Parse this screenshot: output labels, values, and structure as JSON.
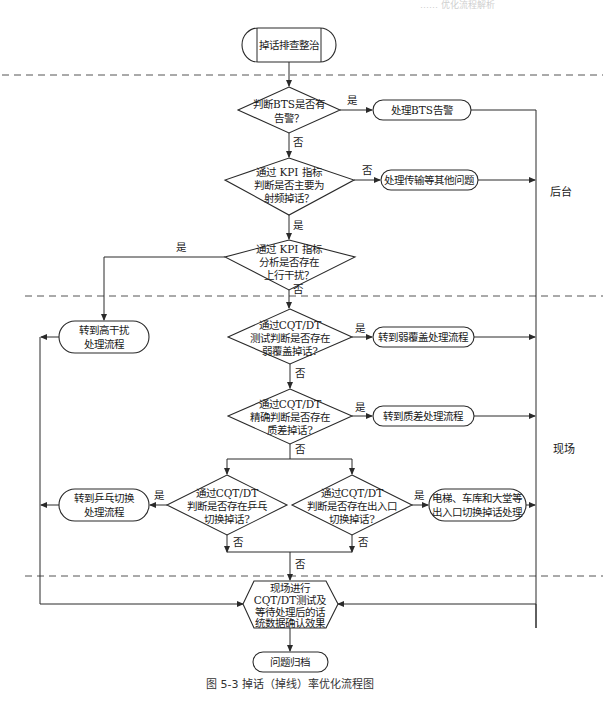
{
  "header_faint": "…… 优化流程解析",
  "zones": {
    "backend": "后台",
    "field": "现场"
  },
  "nodes": {
    "start": "掉话排查整治",
    "d_bts": [
      "判断BTS是否有",
      "告警？"
    ],
    "p_bts": "处理BTS告警",
    "d_kpi_rf": [
      "通过 KPI 指标",
      "判断是否主要为",
      "射频掉话？"
    ],
    "p_transport": "处理传输等其他问题",
    "d_kpi_ul": [
      "通过 KPI 指标",
      "分析是否存在",
      "上行干扰？"
    ],
    "p_high_interf": [
      "转到高干扰",
      "处理流程"
    ],
    "d_weak_cov": [
      "通过CQT/DT",
      "测试判断是否存在",
      "弱覆盖掉话?"
    ],
    "p_weak_cov": "转到弱覆盖处理流程",
    "d_quality": [
      "通过CQT/DT",
      "精确判断是否存在",
      "质差掉话?"
    ],
    "p_quality": "转到质差处理流程",
    "d_pingpong": [
      "通过CQT/DT",
      "判断是否存在乒乓",
      "切换掉话?"
    ],
    "p_pingpong": [
      "转到乒乓切换",
      "处理流程"
    ],
    "d_entrance": [
      "通过CQT/DT",
      "判断是否存在出入口",
      "切换掉话?"
    ],
    "p_entrance": [
      "电梯、车库和大堂等",
      "出入口切换掉话处理"
    ],
    "verify": [
      "现场进行",
      "CQT/DT测试及",
      "等待处理后的话",
      "统数据确认效果"
    ],
    "end": "问题归档"
  },
  "edge_labels": {
    "yes": "是",
    "no": "否"
  },
  "caption": "图 5-3   掉话（掉线）率优化流程图"
}
